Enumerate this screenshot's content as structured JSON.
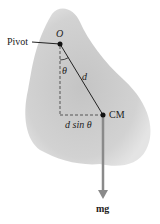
{
  "diagram": {
    "labels": {
      "pivot": "Pivot",
      "origin": "O",
      "theta": "θ",
      "d": "d",
      "dsin": "d sin θ",
      "cm": "CM",
      "mg": "mg"
    },
    "points": {
      "pivot": [
        60,
        44
      ],
      "cm": [
        103,
        115
      ],
      "arrow_tip": [
        103,
        198
      ]
    },
    "colors": {
      "body_fill": "#cfcfcf",
      "body_edge": "#e6e6e6",
      "line": "#222222",
      "arrow": "#8a8a8a",
      "background": "#ffffff"
    }
  }
}
